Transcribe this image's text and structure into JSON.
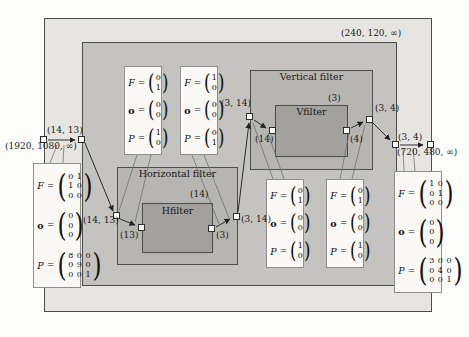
{
  "figure": {
    "labels": {
      "top_rate": "(240, 120, ∞)",
      "source_tokens": "(14, 13)",
      "source_rate": "(1920, 1080, ∞)",
      "hf_in": "(14, 13)",
      "hfilter_in": "(13)",
      "hfilter_window": "(14)",
      "hfilter_out": "(3)",
      "hf_out": "(3, 14)",
      "vf_in": "(3, 14)",
      "vfilter_in": "(14)",
      "vfilter_window": "(3)",
      "vfilter_out": "(4)",
      "vf_out": "(3, 4)",
      "inner_out": "(3, 4)",
      "sink_rate": "(720, 480, ∞)"
    },
    "actors": {
      "horizontal_filter": "Horizontal filter",
      "hfilter": "Hfilter",
      "vertical_filter": "Vertical filter",
      "vfilter": "Vfilter"
    },
    "symbols": {
      "F": "F",
      "o": "o",
      "P": "P",
      "eq": "="
    },
    "annotations": {
      "input": {
        "F": [
          "0 1",
          "1 0",
          "0 0"
        ],
        "o": [
          "0",
          "0",
          "0"
        ],
        "P": [
          "8 0 0",
          "0 9 0",
          "0 0 1"
        ]
      },
      "h_in": {
        "F": [
          "0",
          "1"
        ],
        "o": [
          "0",
          "0"
        ],
        "P": [
          "1",
          "0"
        ]
      },
      "h_out": {
        "F": [
          "1",
          "0"
        ],
        "o": [
          "0",
          "0"
        ],
        "P": [
          "0",
          "1"
        ]
      },
      "v_in": {
        "F": [
          "0",
          "1"
        ],
        "o": [
          "0",
          "0"
        ],
        "P": [
          "1",
          "0"
        ]
      },
      "v_out": {
        "F": [
          "0",
          "1"
        ],
        "o": [
          "0",
          "0"
        ],
        "P": [
          "1",
          "0"
        ]
      },
      "output": {
        "F": [
          "1 0",
          "0 1",
          "0 0"
        ],
        "o": [
          "0",
          "0",
          "0"
        ],
        "P": [
          "3 0 0",
          "0 4 0",
          "0 0 1"
        ]
      }
    },
    "colors": {
      "outer_fill": "#e6e5e2",
      "inner_fill": "#c4c3c0",
      "filter_fill": "#b6b5b2",
      "core_fill": "#a2a19e",
      "annotation_fill": "#faf9f6"
    }
  }
}
